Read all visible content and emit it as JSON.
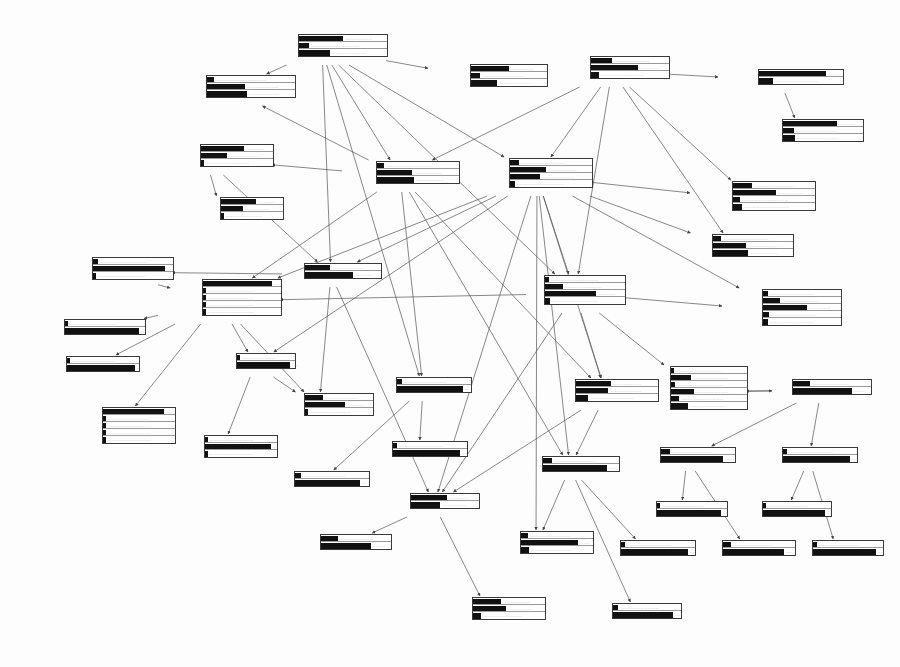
{
  "meta": {
    "bar_color": "#111111",
    "box_border": "#3a3a3a",
    "edge_color": "#555555"
  },
  "nodes": [
    {
      "id": "shape",
      "title": "Shape",
      "x": 258,
      "y": 33,
      "labw": 40,
      "barw": 88,
      "states": [
        {
          "label": "polypoid",
          "p": 0.52
        },
        {
          "label": "scirrheus",
          "p": 0.12
        },
        {
          "label": "ulcerating",
          "p": 0.36
        }
      ]
    },
    {
      "id": "gastro-shape",
      "title": "Gastro-shape",
      "x": 428,
      "y": 63,
      "labw": 42,
      "barw": 76,
      "states": [
        {
          "label": "polypoid",
          "p": 0.52
        },
        {
          "label": "scirrheus",
          "p": 0.13
        },
        {
          "label": "ulcerating",
          "p": 0.35
        }
      ]
    },
    {
      "id": "length",
      "title": "Length",
      "x": 556,
      "y": 55,
      "labw": 34,
      "barw": 78,
      "states": [
        {
          "label": "x<5",
          "p": 0.28
        },
        {
          "label": "5<=x<10",
          "p": 0.62
        },
        {
          "label": "10<=x",
          "p": 0.1
        }
      ]
    },
    {
      "id": "circumf",
      "title": "Circumf",
      "x": 718,
      "y": 68,
      "labw": 40,
      "barw": 84,
      "states": [
        {
          "label": "circular",
          "p": 0.83
        },
        {
          "label": "non-circular",
          "p": 0.17
        }
      ]
    },
    {
      "id": "gastro-circumf",
      "title": "Gastro-circumf",
      "x": 740,
      "y": 118,
      "labw": 42,
      "barw": 80,
      "states": [
        {
          "label": "circular",
          "p": 0.7
        },
        {
          "label": "non-circular",
          "p": 0.14
        },
        {
          "label": "non-determ",
          "p": 0.16
        }
      ]
    },
    {
      "id": "gastro-location",
      "title": "Gastro-location",
      "x": 168,
      "y": 74,
      "labw": 38,
      "barw": 88,
      "states": [
        {
          "label": "proximal",
          "p": 0.08
        },
        {
          "label": "mid",
          "p": 0.45
        },
        {
          "label": "distal",
          "p": 0.47
        }
      ]
    },
    {
      "id": "type",
      "title": "Type",
      "x": 140,
      "y": 143,
      "labw": 60,
      "barw": 72,
      "states": [
        {
          "label": "adeno",
          "p": 0.62
        },
        {
          "label": "squamous",
          "p": 0.38
        },
        {
          "label": "undifferentiated",
          "p": 0.01
        }
      ]
    },
    {
      "id": "biopsy",
      "title": "Biopsy",
      "x": 160,
      "y": 196,
      "labw": 60,
      "barw": 62,
      "states": [
        {
          "label": "adeno",
          "p": 0.6
        },
        {
          "label": "squamous",
          "p": 0.37
        },
        {
          "label": "undifferentiated",
          "p": 0.02
        }
      ]
    },
    {
      "id": "location",
      "title": "Location",
      "x": 342,
      "y": 160,
      "labw": 34,
      "barw": 82,
      "states": [
        {
          "label": "proximal",
          "p": 0.09
        },
        {
          "label": "mid",
          "p": 0.44
        },
        {
          "label": "distal",
          "p": 0.47
        }
      ]
    },
    {
      "id": "passage",
      "title": "Passage",
      "x": 483,
      "y": 157,
      "labw": 26,
      "barw": 82,
      "states": [
        {
          "label": "solid",
          "p": 0.11
        },
        {
          "label": "puree",
          "p": 0.46
        },
        {
          "label": "liquid",
          "p": 0.38
        },
        {
          "label": "none",
          "p": 0.06
        }
      ]
    },
    {
      "id": "gastro-length",
      "title": "Gastro-length",
      "x": 690,
      "y": 180,
      "labw": 42,
      "barw": 82,
      "states": [
        {
          "label": "x<5",
          "p": 0.24
        },
        {
          "label": "5<=x<10",
          "p": 0.54
        },
        {
          "label": "10<=x",
          "p": 0.09
        },
        {
          "label": "non-determ",
          "p": 0.12
        }
      ]
    },
    {
      "id": "weightloss",
      "title": "Weightloss",
      "x": 676,
      "y": 233,
      "labw": 36,
      "barw": 80,
      "states": [
        {
          "label": "none",
          "p": 0.11
        },
        {
          "label": "x<10%",
          "p": 0.43
        },
        {
          "label": "x>=10%",
          "p": 0.46
        }
      ]
    },
    {
      "id": "necrosis",
      "title": "Necrosis",
      "x": 282,
      "y": 262,
      "labw": 22,
      "barw": 76,
      "states": [
        {
          "label": "yes",
          "p": 0.34
        },
        {
          "label": "no",
          "p": 0.66
        }
      ]
    },
    {
      "id": "invasion-organs",
      "title": "Invasion-organs",
      "x": 158,
      "y": 278,
      "labw": 44,
      "barw": 78,
      "states": [
        {
          "label": "none",
          "p": 0.92
        },
        {
          "label": "trachea",
          "p": 0.03
        },
        {
          "label": "mediastinum",
          "p": 0.02
        },
        {
          "label": "diaphragm",
          "p": 0.02
        },
        {
          "label": "heart",
          "p": 0.01
        }
      ]
    },
    {
      "id": "invasion-wall",
      "title": "Invasion-wall",
      "x": 526,
      "y": 274,
      "labw": 18,
      "barw": 80,
      "states": [
        {
          "label": "T1",
          "p": 0.05
        },
        {
          "label": "T2",
          "p": 0.23
        },
        {
          "label": "T3",
          "p": 0.66
        },
        {
          "label": "T4",
          "p": 0.06
        }
      ]
    },
    {
      "id": "endosono-mediast",
      "title": "Endosono-mediast",
      "x": 48,
      "y": 256,
      "labw": 44,
      "barw": 80,
      "states": [
        {
          "label": "yes",
          "p": 0.06
        },
        {
          "label": "no",
          "p": 0.94
        },
        {
          "label": "non-determ",
          "p": 0.04
        }
      ]
    },
    {
      "id": "endosono-wall",
      "title": "Endosono-wall",
      "x": 722,
      "y": 288,
      "labw": 40,
      "barw": 78,
      "states": [
        {
          "label": "T1",
          "p": 0.06
        },
        {
          "label": "T2",
          "p": 0.22
        },
        {
          "label": "T3",
          "p": 0.58
        },
        {
          "label": "T4",
          "p": 0.08
        },
        {
          "label": "non-determ",
          "p": 0.06
        }
      ]
    },
    {
      "id": "bronchoscopy",
      "title": "Bronchoscopy",
      "x": 42,
      "y": 318,
      "labw": 22,
      "barw": 80,
      "states": [
        {
          "label": "yes",
          "p": 0.04
        },
        {
          "label": "no",
          "p": 0.96
        }
      ]
    },
    {
      "id": "lapa-diaphragm",
      "title": "Lapa-diaphragm",
      "x": 46,
      "y": 355,
      "labw": 20,
      "barw": 72,
      "states": [
        {
          "label": "yes",
          "p": 0.02
        },
        {
          "label": "no",
          "p": 0.98
        }
      ]
    },
    {
      "id": "fistula",
      "title": "Fistula",
      "x": 216,
      "y": 352,
      "labw": 20,
      "barw": 58,
      "states": [
        {
          "label": "yes",
          "p": 0.03
        },
        {
          "label": "no",
          "p": 0.97
        }
      ]
    },
    {
      "id": "ct-organs",
      "title": "CT-organs",
      "x": 60,
      "y": 406,
      "labw": 42,
      "barw": 72,
      "states": [
        {
          "label": "none",
          "p": 0.88
        },
        {
          "label": "trachea",
          "p": 0.04
        },
        {
          "label": "mediastinum",
          "p": 0.03
        },
        {
          "label": "diaphragm",
          "p": 0.03
        },
        {
          "label": "heart",
          "p": 0.02
        }
      ]
    },
    {
      "id": "x-fistula",
      "title": "X-fistula",
      "x": 168,
      "y": 434,
      "labw": 36,
      "barw": 72,
      "states": [
        {
          "label": "yes",
          "p": 0.03
        },
        {
          "label": "no",
          "p": 0.95
        },
        {
          "label": "non-determ",
          "p": 0.03
        }
      ]
    },
    {
      "id": "gastro-necrosis",
      "title": "Gastro-necrosis",
      "x": 266,
      "y": 392,
      "labw": 38,
      "barw": 68,
      "states": [
        {
          "label": "yes",
          "p": 0.28
        },
        {
          "label": "no",
          "p": 0.62
        },
        {
          "label": "non-determ",
          "p": 0.02
        }
      ]
    },
    {
      "id": "sono-cervix",
      "title": "Sono-cervix",
      "x": 272,
      "y": 470,
      "labw": 22,
      "barw": 74,
      "states": [
        {
          "label": "yes",
          "p": 0.09
        },
        {
          "label": "no",
          "p": 0.91
        }
      ]
    },
    {
      "id": "metas-cervix",
      "title": "Metas-cervix",
      "x": 376,
      "y": 376,
      "labw": 20,
      "barw": 74,
      "states": [
        {
          "label": "yes",
          "p": 0.07
        },
        {
          "label": "no",
          "p": 0.93
        }
      ]
    },
    {
      "id": "physical-exam",
      "title": "Physical-exam",
      "x": 372,
      "y": 440,
      "labw": 20,
      "barw": 74,
      "states": [
        {
          "label": "yes",
          "p": 0.06
        },
        {
          "label": "no",
          "p": 0.94
        }
      ]
    },
    {
      "id": "lymph-metas",
      "title": "Lymph-metas",
      "x": 555,
      "y": 378,
      "labw": 20,
      "barw": 82,
      "states": [
        {
          "label": "N0",
          "p": 0.44
        },
        {
          "label": "N1",
          "p": 0.41
        },
        {
          "label": "M1",
          "p": 0.15
        }
      ]
    },
    {
      "id": "stage",
      "title": "Stage",
      "x": 648,
      "y": 365,
      "labw": 22,
      "barw": 76,
      "states": [
        {
          "label": "I",
          "p": 0.04
        },
        {
          "label": "IIA",
          "p": 0.27
        },
        {
          "label": "IIB",
          "p": 0.06
        },
        {
          "label": "III",
          "p": 0.31
        },
        {
          "label": "IVA",
          "p": 0.11
        },
        {
          "label": "IVB",
          "p": 0.23
        }
      ]
    },
    {
      "id": "haema-metas",
      "title": "Haema-metas",
      "x": 772,
      "y": 378,
      "labw": 20,
      "barw": 78,
      "states": [
        {
          "label": "yes",
          "p": 0.22
        },
        {
          "label": "no",
          "p": 0.78
        }
      ]
    },
    {
      "id": "metas-liver",
      "title": "Metas-liver",
      "x": 640,
      "y": 446,
      "labw": 20,
      "barw": 74,
      "states": [
        {
          "label": "yes",
          "p": 0.13
        },
        {
          "label": "no",
          "p": 0.87
        }
      ]
    },
    {
      "id": "metas-lungs",
      "title": "Metas-lungs",
      "x": 762,
      "y": 446,
      "labw": 20,
      "barw": 74,
      "states": [
        {
          "label": "yes",
          "p": 0.06
        },
        {
          "label": "no",
          "p": 0.94
        }
      ]
    },
    {
      "id": "metas-truncus",
      "title": "Metas-truncus",
      "x": 522,
      "y": 455,
      "labw": 20,
      "barw": 76,
      "states": [
        {
          "label": "yes",
          "p": 0.12
        },
        {
          "label": "no",
          "p": 0.88
        }
      ]
    },
    {
      "id": "metas-loco",
      "title": "Metas-loco",
      "x": 390,
      "y": 492,
      "labw": 20,
      "barw": 68,
      "states": [
        {
          "label": "yes",
          "p": 0.55
        },
        {
          "label": "no",
          "p": 0.45
        }
      ]
    },
    {
      "id": "lapa-liver",
      "title": "Lapa-liver",
      "x": 636,
      "y": 500,
      "labw": 20,
      "barw": 70,
      "states": [
        {
          "label": "yes",
          "p": 0.05
        },
        {
          "label": "no",
          "p": 0.95
        }
      ]
    },
    {
      "id": "x-lungs",
      "title": "X-lungs",
      "x": 742,
      "y": 500,
      "labw": 20,
      "barw": 68,
      "states": [
        {
          "label": "yes",
          "p": 0.05
        },
        {
          "label": "no",
          "p": 0.95
        }
      ]
    },
    {
      "id": "ct-truncus",
      "title": "CT-truncus",
      "x": 600,
      "y": 539,
      "labw": 20,
      "barw": 74,
      "states": [
        {
          "label": "yes",
          "p": 0.06
        },
        {
          "label": "no",
          "p": 0.94
        }
      ]
    },
    {
      "id": "ct-liver",
      "title": "CT-liver",
      "x": 702,
      "y": 539,
      "labw": 20,
      "barw": 72,
      "states": [
        {
          "label": "yes",
          "p": 0.12
        },
        {
          "label": "no",
          "p": 0.88
        }
      ]
    },
    {
      "id": "ct-lungs",
      "title": "CT-lungs",
      "x": 792,
      "y": 539,
      "labw": 20,
      "barw": 70,
      "states": [
        {
          "label": "yes",
          "p": 0.06
        },
        {
          "label": "no",
          "p": 0.94
        }
      ]
    },
    {
      "id": "ct-loco",
      "title": "CT-loco",
      "x": 300,
      "y": 533,
      "labw": 20,
      "barw": 70,
      "states": [
        {
          "label": "yes",
          "p": 0.26
        },
        {
          "label": "no",
          "p": 0.74
        }
      ]
    },
    {
      "id": "endosono-truncus",
      "title": "Endosono-truncus",
      "x": 480,
      "y": 530,
      "labw": 40,
      "barw": 72,
      "states": [
        {
          "label": "yes",
          "p": 0.1
        },
        {
          "label": "no",
          "p": 0.82
        },
        {
          "label": "non-determ",
          "p": 0.11
        }
      ]
    },
    {
      "id": "endosono-loco",
      "title": "Endosono-loco",
      "x": 432,
      "y": 596,
      "labw": 40,
      "barw": 72,
      "states": [
        {
          "label": "yes",
          "p": 0.41
        },
        {
          "label": "no",
          "p": 0.48
        },
        {
          "label": "non-determ",
          "p": 0.12
        }
      ]
    },
    {
      "id": "lapa-truncus",
      "title": "Lapa-truncus",
      "x": 592,
      "y": 602,
      "labw": 20,
      "barw": 68,
      "states": [
        {
          "label": "yes",
          "p": 0.08
        },
        {
          "label": "no",
          "p": 0.92
        }
      ]
    }
  ],
  "edges": [
    [
      "shape",
      "gastro-shape"
    ],
    [
      "shape",
      "location"
    ],
    [
      "shape",
      "passage"
    ],
    [
      "shape",
      "necrosis"
    ],
    [
      "shape",
      "invasion-wall"
    ],
    [
      "shape",
      "metas-cervix"
    ],
    [
      "shape",
      "gastro-location"
    ],
    [
      "length",
      "circumf"
    ],
    [
      "length",
      "gastro-length"
    ],
    [
      "length",
      "passage"
    ],
    [
      "length",
      "invasion-wall"
    ],
    [
      "length",
      "weightloss"
    ],
    [
      "length",
      "location"
    ],
    [
      "circumf",
      "gastro-circumf"
    ],
    [
      "location",
      "gastro-location"
    ],
    [
      "location",
      "type"
    ],
    [
      "location",
      "lymph-metas"
    ],
    [
      "location",
      "metas-cervix"
    ],
    [
      "location",
      "metas-truncus"
    ],
    [
      "location",
      "invasion-organs"
    ],
    [
      "type",
      "biopsy"
    ],
    [
      "type",
      "necrosis"
    ],
    [
      "passage",
      "weightloss"
    ],
    [
      "passage",
      "invasion-wall"
    ],
    [
      "passage",
      "endosono-wall"
    ],
    [
      "passage",
      "gastro-length"
    ],
    [
      "passage",
      "necrosis"
    ],
    [
      "passage",
      "invasion-organs"
    ],
    [
      "passage",
      "metas-loco"
    ],
    [
      "passage",
      "metas-truncus"
    ],
    [
      "passage",
      "fistula"
    ],
    [
      "passage",
      "endosono-truncus"
    ],
    [
      "passage",
      "lymph-metas"
    ],
    [
      "invasion-wall",
      "endosono-wall"
    ],
    [
      "invasion-wall",
      "invasion-organs"
    ],
    [
      "invasion-wall",
      "stage"
    ],
    [
      "invasion-wall",
      "lymph-metas"
    ],
    [
      "invasion-wall",
      "metas-loco"
    ],
    [
      "invasion-organs",
      "endosono-mediast"
    ],
    [
      "invasion-organs",
      "bronchoscopy"
    ],
    [
      "invasion-organs",
      "lapa-diaphragm"
    ],
    [
      "invasion-organs",
      "ct-organs"
    ],
    [
      "invasion-organs",
      "fistula"
    ],
    [
      "invasion-organs",
      "gastro-necrosis"
    ],
    [
      "necrosis",
      "gastro-necrosis"
    ],
    [
      "necrosis",
      "endosono-mediast"
    ],
    [
      "fistula",
      "x-fistula"
    ],
    [
      "fistula",
      "gastro-necrosis"
    ],
    [
      "metas-cervix",
      "sono-cervix"
    ],
    [
      "metas-cervix",
      "physical-exam"
    ],
    [
      "lymph-metas",
      "stage"
    ],
    [
      "lymph-metas",
      "metas-truncus"
    ],
    [
      "lymph-metas",
      "metas-loco"
    ],
    [
      "stage",
      "haema-metas"
    ],
    [
      "haema-metas",
      "metas-liver"
    ],
    [
      "haema-metas",
      "metas-lungs"
    ],
    [
      "haema-metas",
      "stage"
    ],
    [
      "metas-liver",
      "lapa-liver"
    ],
    [
      "metas-liver",
      "ct-liver"
    ],
    [
      "metas-lungs",
      "x-lungs"
    ],
    [
      "metas-lungs",
      "ct-lungs"
    ],
    [
      "metas-truncus",
      "endosono-truncus"
    ],
    [
      "metas-truncus",
      "ct-truncus"
    ],
    [
      "metas-truncus",
      "lapa-truncus"
    ],
    [
      "metas-loco",
      "ct-loco"
    ],
    [
      "metas-loco",
      "endosono-loco"
    ],
    [
      "necrosis",
      "metas-loco"
    ]
  ]
}
